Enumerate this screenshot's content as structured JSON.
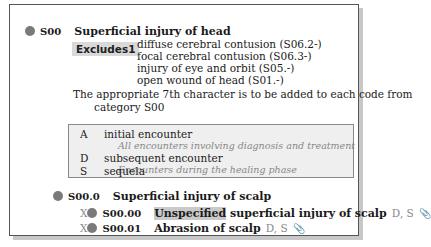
{
  "category": {
    "code": "S00",
    "title": "Superficial injury of head",
    "excludes_label": "Excludes1",
    "excludes": [
      "diffuse cerebral contusion (S06.2-)",
      "focal cerebral contusion (S06.3-)",
      "injury of eye and orbit (S05.-)",
      "open wound of head (S01.-)"
    ],
    "note_line1": "The appropriate 7th character is to be added to each code from",
    "note_line2": "category S00"
  },
  "seventh_characters": [
    {
      "letter": "A",
      "label": "initial encounter",
      "desc": "All encounters involving diagnosis and treatment"
    },
    {
      "letter": "D",
      "label": "subsequent encounter",
      "desc": "Encounters during the healing phase"
    },
    {
      "letter": "S",
      "label": "sequela",
      "desc": ""
    }
  ],
  "subcategory": {
    "code": "S00.0",
    "title": "Superficial injury of scalp"
  },
  "codes": [
    {
      "placeholder": "X",
      "code": "S00.00",
      "highlight": "Unspecified",
      "title": " superficial injury of scalp",
      "flags": "D, S",
      "icon": "paperclip-icon"
    },
    {
      "placeholder": "X",
      "code": "S00.01",
      "highlight": "",
      "title": "Abrasion of scalp",
      "flags": "D, S",
      "icon": "paperclip-icon"
    }
  ]
}
